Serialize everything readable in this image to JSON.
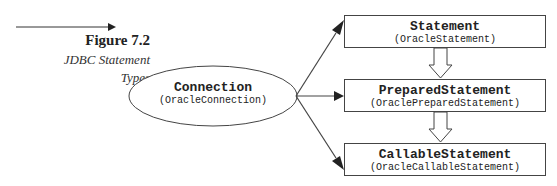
{
  "caption": {
    "figure_number": "Figure 7.2",
    "title_line1": "JDBC Statement",
    "title_line2": "Types"
  },
  "diagram": {
    "source": {
      "name": "Connection",
      "impl": "(OracleConnection)"
    },
    "targets": [
      {
        "name": "Statement",
        "impl": "(OracleStatement)"
      },
      {
        "name": "PreparedStatement",
        "impl": "(OraclePreparedStatement)"
      },
      {
        "name": "CallableStatement",
        "impl": "(OracleCallableStatement)"
      }
    ],
    "edges": [
      {
        "from": "Connection",
        "to": "Statement",
        "type": "arrow"
      },
      {
        "from": "Connection",
        "to": "PreparedStatement",
        "type": "arrow"
      },
      {
        "from": "Connection",
        "to": "CallableStatement",
        "type": "arrow"
      },
      {
        "from": "Statement",
        "to": "PreparedStatement",
        "type": "inheritance-block-arrow"
      },
      {
        "from": "PreparedStatement",
        "to": "CallableStatement",
        "type": "inheritance-block-arrow"
      }
    ]
  },
  "colors": {
    "line": "#444444",
    "text": "#222222",
    "background": "#ffffff"
  }
}
